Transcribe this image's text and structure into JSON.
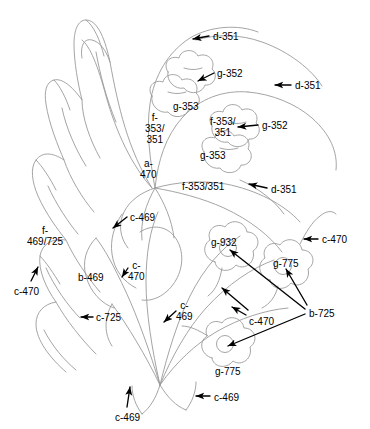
{
  "figure": {
    "type": "technical-line-drawing",
    "line_color": "#9a9a9a",
    "annotation_color": "#000000",
    "background_color": "#ffffff",
    "width": 370,
    "height": 429
  },
  "annotations": [
    {
      "id": "a01",
      "text": "d-351",
      "x": 213,
      "y": 31,
      "align": "left",
      "arrow": true
    },
    {
      "id": "a02",
      "text": "g-352",
      "x": 217,
      "y": 68,
      "align": "left",
      "arrow": true
    },
    {
      "id": "a03",
      "text": "d-351",
      "x": 295,
      "y": 80,
      "align": "left",
      "arrow": true
    },
    {
      "id": "a04",
      "text": "g-353",
      "x": 173,
      "y": 101,
      "align": "left",
      "arrow": false
    },
    {
      "id": "a05",
      "text": "f-\n353/\n351",
      "x": 145,
      "y": 112,
      "align": "center",
      "arrow": false
    },
    {
      "id": "a06",
      "text": "f-353/\n351",
      "x": 210,
      "y": 116,
      "align": "center",
      "arrow": false
    },
    {
      "id": "a07",
      "text": "g-352",
      "x": 262,
      "y": 120,
      "align": "left",
      "arrow": true
    },
    {
      "id": "a08",
      "text": "g-353",
      "x": 200,
      "y": 150,
      "align": "left",
      "arrow": false
    },
    {
      "id": "a09",
      "text": "a-\n470",
      "x": 140,
      "y": 158,
      "align": "center",
      "arrow": false
    },
    {
      "id": "a10",
      "text": "f-353/351",
      "x": 182,
      "y": 181,
      "align": "left",
      "arrow": false
    },
    {
      "id": "a11",
      "text": "d-351",
      "x": 271,
      "y": 184,
      "align": "left",
      "arrow": true
    },
    {
      "id": "a12",
      "text": "c-469",
      "x": 130,
      "y": 212,
      "align": "left",
      "arrow": true
    },
    {
      "id": "a13",
      "text": "c-470",
      "x": 322,
      "y": 234,
      "align": "left",
      "arrow": true
    },
    {
      "id": "a14",
      "text": "g-932",
      "x": 211,
      "y": 237,
      "align": "left",
      "arrow": false
    },
    {
      "id": "a15",
      "text": "f-\n469/725",
      "x": 27,
      "y": 225,
      "align": "center",
      "arrow": false
    },
    {
      "id": "a16",
      "text": "g-775",
      "x": 273,
      "y": 258,
      "align": "left",
      "arrow": false
    },
    {
      "id": "a17",
      "text": "c-\n470",
      "x": 128,
      "y": 260,
      "align": "center",
      "arrow": true
    },
    {
      "id": "a18",
      "text": "b-469",
      "x": 78,
      "y": 272,
      "align": "left",
      "arrow": false
    },
    {
      "id": "a19",
      "text": "c-470",
      "x": 14,
      "y": 286,
      "align": "left",
      "arrow": true
    },
    {
      "id": "a20",
      "text": "c-\n469",
      "x": 176,
      "y": 300,
      "align": "center",
      "arrow": true
    },
    {
      "id": "a21",
      "text": "c-725",
      "x": 96,
      "y": 312,
      "align": "left",
      "arrow": true
    },
    {
      "id": "a22",
      "text": "c-470",
      "x": 249,
      "y": 316,
      "align": "left",
      "arrow": true
    },
    {
      "id": "a23",
      "text": "b-725",
      "x": 309,
      "y": 308,
      "align": "left",
      "arrow": true
    },
    {
      "id": "a24",
      "text": "g-775",
      "x": 215,
      "y": 366,
      "align": "left",
      "arrow": false
    },
    {
      "id": "a25",
      "text": "c-469",
      "x": 214,
      "y": 392,
      "align": "left",
      "arrow": true
    },
    {
      "id": "a26",
      "text": "c-469",
      "x": 115,
      "y": 412,
      "align": "left",
      "arrow": true
    }
  ],
  "codes_used": [
    "a-470",
    "b-469",
    "b-725",
    "c-469",
    "c-470",
    "c-725",
    "d-351",
    "f-353/351",
    "f-469/725",
    "g-352",
    "g-353",
    "g-775",
    "g-932"
  ]
}
